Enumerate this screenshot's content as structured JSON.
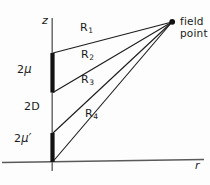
{
  "figure": {
    "axes": {
      "vertical": {
        "label": "z",
        "name": "z-axis"
      },
      "horizontal": {
        "label": "r",
        "name": "r-axis"
      }
    },
    "annotations": {
      "field_point": "field\npoint",
      "field_point_line1": "field",
      "field_point_line2": "point",
      "segment_upper": "2μ",
      "segment_upper_plain": "2",
      "segment_upper_greek": "μ",
      "gap": "2D",
      "segment_lower": "2μ′",
      "segment_lower_plain": "2",
      "segment_lower_greek": "μ′"
    },
    "rays": [
      {
        "id": "R1",
        "base": "R",
        "subscript": "1",
        "label": "R₁"
      },
      {
        "id": "R2",
        "base": "R",
        "subscript": "2",
        "label": "R₂"
      },
      {
        "id": "R3",
        "base": "R",
        "subscript": "3",
        "label": "R₃"
      },
      {
        "id": "R4",
        "base": "R",
        "subscript": "4",
        "label": "R₄"
      }
    ],
    "colors": {
      "ink": "#1a1a1a",
      "axis": "#4a4a4a",
      "background": "#fdfdfd"
    }
  }
}
